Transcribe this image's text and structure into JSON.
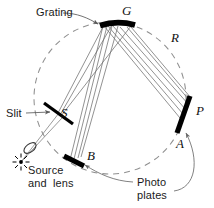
{
  "figure": {
    "background_color": "#ffffff",
    "width": 214,
    "height": 208
  },
  "colors": {
    "ray": "#6e6e6e",
    "optic": "#000000",
    "circle_dashed": "#8c8c8c",
    "leader": "#6a6a6a",
    "text": "#1a1a1a"
  },
  "labels": {
    "grating": "Grating",
    "slit": "Slit",
    "source_line1": "Source",
    "source_line2": "and  lens",
    "photo_line1": "Photo",
    "photo_line2": "plates"
  },
  "points": {
    "grating": "G",
    "slit": "S",
    "plate_b": "B",
    "plate_a": "A",
    "plate_p": "P",
    "radius": "R"
  },
  "elements": [
    {
      "name": "grating",
      "symbol": "G",
      "kind": "concave-diffraction-grating"
    },
    {
      "name": "slit",
      "symbol": "S",
      "kind": "entrance-slit"
    },
    {
      "name": "photographic-plate-left",
      "symbol": "B",
      "kind": "photo-plate"
    },
    {
      "name": "photographic-plate-right",
      "symbol": "P",
      "kind": "photo-plate",
      "near_end": "A"
    },
    {
      "name": "rowland-circle",
      "symbol": "R",
      "kind": "dashed-circle"
    },
    {
      "name": "source",
      "kind": "light-source-starburst"
    },
    {
      "name": "lens",
      "kind": "condenser-lens"
    }
  ]
}
